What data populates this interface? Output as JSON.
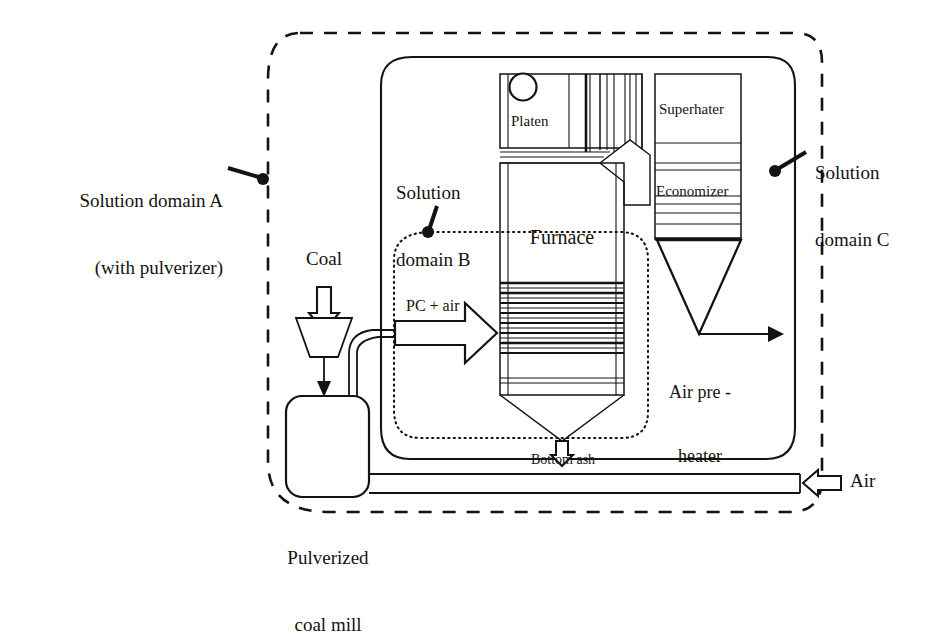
{
  "diagram": {
    "type": "process-schematic"
  },
  "domains": [
    {
      "id": "A",
      "label_line1": "Solution domain A",
      "label_line2": "(with pulverizer)",
      "boundary_style": "dashed",
      "color": "#000000"
    },
    {
      "id": "B",
      "label_line1": "Solution",
      "label_line2": "domain B",
      "boundary_style": "dotted",
      "color": "#000000"
    },
    {
      "id": "C",
      "label_line1": "Solution",
      "label_line2": "domain C",
      "boundary_style": "solid",
      "color": "#000000"
    }
  ],
  "components": {
    "platen": "Platen",
    "superheater": "Superhater",
    "economizer": "Economizer",
    "furnace": "Furnace",
    "air_preheater_line1": "Air pre -",
    "air_preheater_line2": "heater",
    "mill_line1": "Pulverized",
    "mill_line2": "coal mill"
  },
  "streams": {
    "coal": "Coal",
    "pc_air": "PC + air",
    "bottom_ash": "Bottom ash",
    "air": "Air"
  },
  "colors": {
    "line": "#15130f",
    "text": "#15130f",
    "background": "#ffffff"
  }
}
